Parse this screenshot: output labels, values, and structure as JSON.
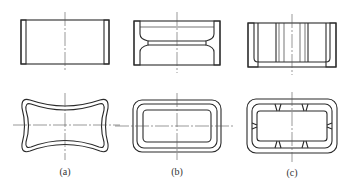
{
  "figure": {
    "panels": [
      {
        "id": "a",
        "label": "(a)",
        "section_view": "straight cylindrical wall",
        "plan_view": "concave-sided rounded rectangle"
      },
      {
        "id": "b",
        "label": "(b)",
        "section_view": "wall with central groove",
        "plan_view": "nested rounded rectangles"
      },
      {
        "id": "c",
        "label": "(c)",
        "section_view": "wall with inner vertical ribs",
        "plan_view": "nested rounded rectangles with notches"
      }
    ]
  }
}
